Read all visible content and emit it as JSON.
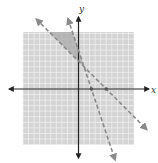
{
  "chart_data": {
    "type": "line",
    "title": "",
    "xlabel": "x",
    "ylabel": "y",
    "xlim": [
      -10,
      10
    ],
    "ylim": [
      -10,
      10
    ],
    "grid": true,
    "series": [
      {
        "name": "boundary-1",
        "equation": "y = -x + 5",
        "style": "dashed",
        "slope": -1,
        "intercept": 5,
        "x_intercept": 5
      },
      {
        "name": "boundary-2",
        "equation": "y = -3x + 7",
        "style": "dashed",
        "slope": -3,
        "intercept": 7,
        "x_intercept": 2.33
      }
    ],
    "points": [
      {
        "x": 5,
        "y": 0
      },
      {
        "x": 2.33,
        "y": 0
      }
    ],
    "shaded_region": "between the lines above their intersection at (1, 4)",
    "intersection": {
      "x": 1,
      "y": 4
    }
  },
  "labels": {
    "x_axis": "x",
    "y_axis": "y"
  },
  "colors": {
    "grid_bg": "#d4d4d4",
    "grid_line": "#f2f2f2",
    "shade": "#a9a9a9",
    "axis": "#222222",
    "dash": "#8a8a8a"
  }
}
